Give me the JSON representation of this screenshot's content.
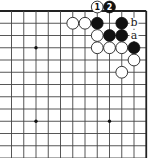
{
  "diagram": {
    "type": "go-board-corner",
    "view": "top-right corner",
    "columns_visible": 12,
    "rows_visible": 13,
    "edges": [
      "top",
      "right"
    ],
    "star_points": [
      {
        "col": 2,
        "row": 3
      },
      {
        "col": 2,
        "row": 9
      },
      {
        "col": 8,
        "row": 9
      }
    ],
    "stones": [
      {
        "color": "white",
        "col": 7,
        "row": 0,
        "label": "1"
      },
      {
        "color": "black",
        "col": 8,
        "row": 0,
        "label": "2"
      },
      {
        "color": "white",
        "col": 5,
        "row": 1,
        "label": ""
      },
      {
        "color": "white",
        "col": 6,
        "row": 1,
        "label": ""
      },
      {
        "color": "black",
        "col": 7,
        "row": 1,
        "label": ""
      },
      {
        "color": "black",
        "col": 9,
        "row": 1,
        "label": ""
      },
      {
        "color": "white",
        "col": 7,
        "row": 2,
        "label": ""
      },
      {
        "color": "black",
        "col": 8,
        "row": 2,
        "label": ""
      },
      {
        "color": "black",
        "col": 9,
        "row": 2,
        "label": ""
      },
      {
        "color": "white",
        "col": 7,
        "row": 3,
        "label": ""
      },
      {
        "color": "white",
        "col": 8,
        "row": 3,
        "label": ""
      },
      {
        "color": "white",
        "col": 9,
        "row": 3,
        "label": ""
      },
      {
        "color": "black",
        "col": 10,
        "row": 3,
        "label": ""
      },
      {
        "color": "white",
        "col": 10,
        "row": 4,
        "label": ""
      },
      {
        "color": "white",
        "col": 9,
        "row": 5,
        "label": ""
      }
    ],
    "point_labels": [
      {
        "text": "b",
        "col": 10,
        "row": 1
      },
      {
        "text": "a",
        "col": 10,
        "row": 2
      }
    ],
    "colors": {
      "black_stone": "#111111",
      "white_stone": "#ffffff",
      "line": "#444444",
      "background": "#ffffff"
    }
  }
}
